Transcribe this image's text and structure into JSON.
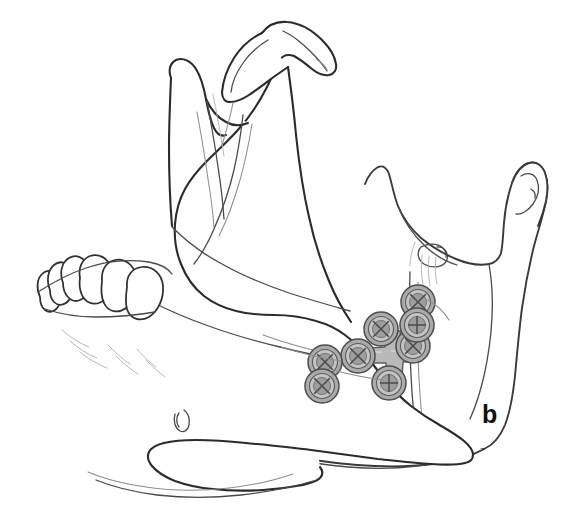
{
  "figure": {
    "panel_label": "b",
    "caption_text": "",
    "background_color": "#ffffff",
    "line_color": "#2b2b2b"
  },
  "anatomy": {
    "structures": [
      {
        "name": "condylar-process-near",
        "label": "Condylar process (near side)"
      },
      {
        "name": "coronoid-process-near",
        "label": "Coronoid process (near side)"
      },
      {
        "name": "sigmoid-notch-near",
        "label": "Mandibular (sigmoid) notch"
      },
      {
        "name": "ramus-near",
        "label": "Ramus (near side)"
      },
      {
        "name": "mandibular-body",
        "label": "Body of mandible"
      },
      {
        "name": "mental-foramen",
        "label": "Mental foramen"
      },
      {
        "name": "alveolar-teeth",
        "label": "Mandibular teeth"
      },
      {
        "name": "ramus-far",
        "label": "Ramus (far side)"
      },
      {
        "name": "condylar-process-far",
        "label": "Condylar process (far side)"
      },
      {
        "name": "coronoid-process-far",
        "label": "Coronoid process (far side)"
      },
      {
        "name": "lingula-mandibular-foramen",
        "label": "Lingula / mandibular foramen"
      },
      {
        "name": "oblique-line",
        "label": "External oblique line"
      }
    ],
    "tooth_count": 6
  },
  "hardware": {
    "plate": {
      "name": "cross-shaped-bone-plate",
      "shape": "cross",
      "arm_count": 4,
      "color": "#b9b9b9",
      "center_x": 392,
      "center_y": 357
    },
    "screws": [
      {
        "id": "plate-screw-superior",
        "cx": 381,
        "cy": 329,
        "r": 17,
        "on_plate": true
      },
      {
        "id": "plate-screw-inferior",
        "cx": 389,
        "cy": 383,
        "r": 17,
        "on_plate": true
      },
      {
        "id": "plate-screw-anterior",
        "cx": 358,
        "cy": 356,
        "r": 17,
        "on_plate": true
      },
      {
        "id": "plate-screw-posterior",
        "cx": 413,
        "cy": 346,
        "r": 17,
        "on_plate": true
      },
      {
        "id": "free-screw-upper-right",
        "cx": 418,
        "cy": 302,
        "r": 17,
        "on_plate": false
      },
      {
        "id": "free-screw-lower-right",
        "cx": 417,
        "cy": 325,
        "r": 17,
        "on_plate": false
      },
      {
        "id": "free-screw-upper-left",
        "cx": 325,
        "cy": 362,
        "r": 17,
        "on_plate": false
      },
      {
        "id": "free-screw-lower-left",
        "cx": 322,
        "cy": 386,
        "r": 17,
        "on_plate": false
      }
    ],
    "screw_head_type": "cross-slot",
    "total_screw_count": 8
  }
}
